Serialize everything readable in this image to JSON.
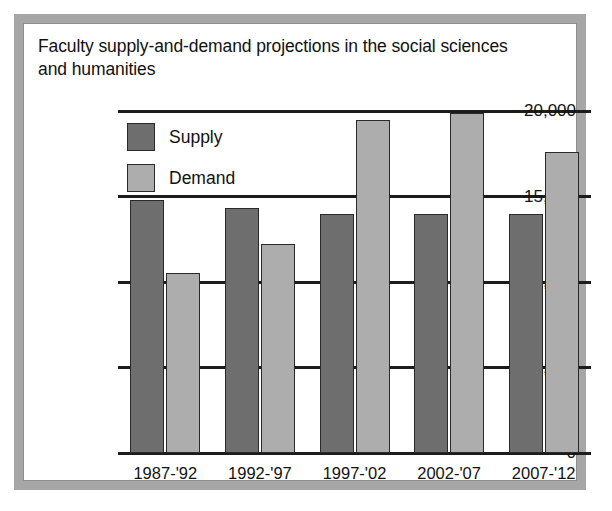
{
  "figure": {
    "title": "Faculty supply-and-demand projections in the social sciences and humanities"
  },
  "chart_data": {
    "type": "bar",
    "title": "Faculty supply-and-demand projections in the social sciences and humanities",
    "xlabel": "",
    "ylabel": "",
    "categories": [
      "1987-'92",
      "1992-'97",
      "1997-'02",
      "2002-'07",
      "2007-'12"
    ],
    "series": [
      {
        "name": "Supply",
        "color": "#6e6e6e",
        "values": [
          14800,
          14300,
          14000,
          14000,
          14000
        ]
      },
      {
        "name": "Demand",
        "color": "#adadad",
        "values": [
          10500,
          12200,
          19500,
          19900,
          17600
        ]
      }
    ],
    "ylim": [
      0,
      20000
    ],
    "yticks": [
      0,
      5000,
      10000,
      15000,
      20000
    ],
    "ytick_labels": [
      "0",
      "5,000",
      "10,000",
      "15,000",
      "20,000"
    ],
    "grid": true,
    "legend_position": "upper-left-inside"
  }
}
